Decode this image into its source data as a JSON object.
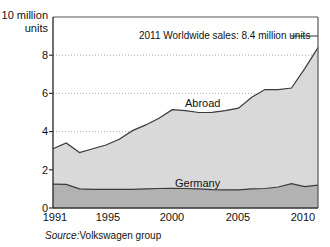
{
  "chart_data": {
    "type": "area",
    "title": "",
    "subtitle": "",
    "xlabel": "",
    "ylabel": "10 million\nunits",
    "ylim": [
      0,
      10
    ],
    "xlim": [
      1991,
      2011
    ],
    "grid": true,
    "stacked": true,
    "legend_position": "inline-labels",
    "yticks": [
      "0",
      "2",
      "4",
      "6",
      "8"
    ],
    "ytick_values": [
      0,
      2,
      4,
      6,
      8
    ],
    "xticks": [
      "1991",
      "1995",
      "2000",
      "2005",
      "2010"
    ],
    "xtick_values": [
      1991,
      1995,
      2000,
      2005,
      2010
    ],
    "x": [
      1991,
      1992,
      1993,
      1994,
      1995,
      1996,
      1997,
      1998,
      1999,
      2000,
      2001,
      2002,
      2003,
      2004,
      2005,
      2006,
      2007,
      2008,
      2009,
      2010,
      2011
    ],
    "series": [
      {
        "name": "Germany",
        "color": "#b2b2b2",
        "values": [
          1.25,
          1.24,
          1.0,
          0.98,
          0.97,
          0.97,
          0.98,
          1.0,
          1.02,
          1.03,
          1.02,
          1.0,
          0.96,
          0.95,
          0.95,
          1.0,
          1.02,
          1.1,
          1.28,
          1.12,
          1.2
        ]
      },
      {
        "name": "Abroad",
        "color": "#d9d9d9",
        "values": [
          1.85,
          2.16,
          1.9,
          2.12,
          2.33,
          2.63,
          3.07,
          3.35,
          3.68,
          4.12,
          4.08,
          4.0,
          4.05,
          4.15,
          4.28,
          4.8,
          5.18,
          5.1,
          5.0,
          6.18,
          7.2
        ]
      }
    ],
    "totals": [
      3.1,
      3.4,
      2.9,
      3.1,
      3.3,
      3.6,
      4.05,
      4.35,
      4.7,
      5.15,
      5.1,
      5.0,
      5.01,
      5.1,
      5.23,
      5.8,
      6.2,
      6.2,
      6.28,
      7.3,
      8.4
    ],
    "annotations": [
      {
        "name": "worldwide-sales-callout",
        "text": "2011 Worldwide sales: 8.4 million units",
        "value": 8.4,
        "year": 2011,
        "leader_line": true
      }
    ],
    "series_inline_labels": [
      {
        "name": "Abroad",
        "text": "Abroad"
      },
      {
        "name": "Germany",
        "text": "Germany"
      }
    ]
  },
  "source": {
    "label": "Source:",
    "value": "Volkswagen group"
  },
  "colors": {
    "abroad_fill": "#d9d9d9",
    "germany_fill": "#b2b2b2",
    "line": "#3a3a3a",
    "axis": "#555555",
    "grid": "#999999",
    "background": "#ffffff",
    "text": "#111111"
  }
}
